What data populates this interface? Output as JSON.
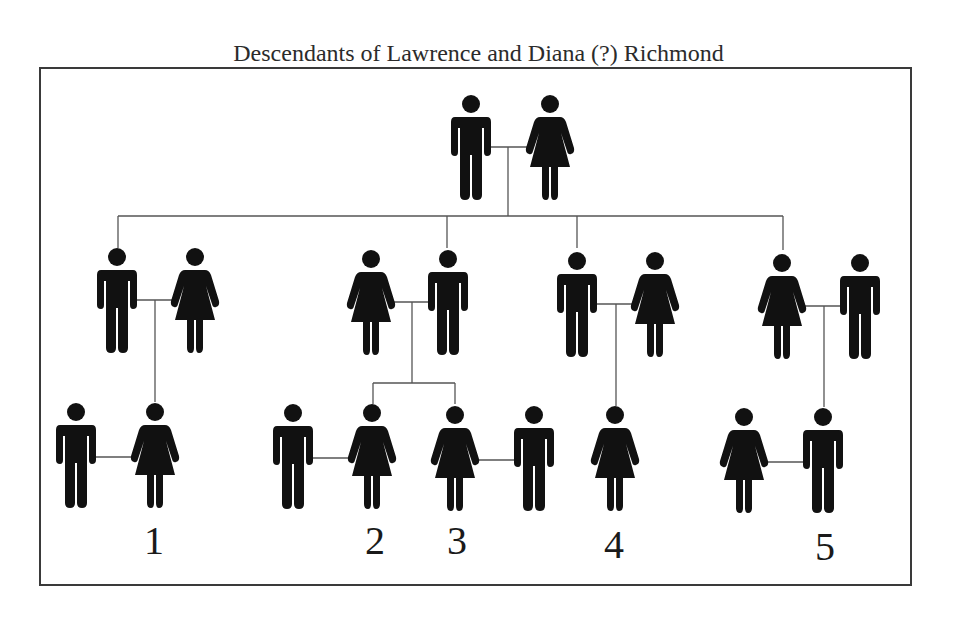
{
  "title": "Descendants of Lawrence and Diana (?) Richmond",
  "colors": {
    "figure": "#111111",
    "line": "#555555",
    "frame": "#3a3a3a",
    "text": "#2b2b2b"
  },
  "generations": [
    {
      "level": 0,
      "couples": [
        {
          "members": [
            {
              "sex": "male",
              "icon": "man-icon"
            },
            {
              "sex": "female",
              "icon": "woman-icon"
            }
          ]
        }
      ]
    },
    {
      "level": 1,
      "couples": [
        {
          "members": [
            {
              "sex": "male",
              "icon": "man-icon",
              "descendant": true
            },
            {
              "sex": "female",
              "icon": "woman-icon"
            }
          ]
        },
        {
          "members": [
            {
              "sex": "female",
              "icon": "woman-icon"
            },
            {
              "sex": "male",
              "icon": "man-icon",
              "descendant": true
            }
          ]
        },
        {
          "members": [
            {
              "sex": "male",
              "icon": "man-icon",
              "descendant": true
            },
            {
              "sex": "female",
              "icon": "woman-icon"
            }
          ]
        },
        {
          "members": [
            {
              "sex": "female",
              "icon": "woman-icon",
              "descendant": true
            },
            {
              "sex": "male",
              "icon": "man-icon"
            }
          ]
        }
      ]
    },
    {
      "level": 2,
      "couples": [
        {
          "members": [
            {
              "sex": "male",
              "icon": "man-icon"
            },
            {
              "sex": "female",
              "icon": "woman-icon",
              "descendant": true,
              "label": "1"
            }
          ]
        },
        {
          "members": [
            {
              "sex": "male",
              "icon": "man-icon"
            },
            {
              "sex": "female",
              "icon": "woman-icon",
              "descendant": true,
              "label": "2"
            }
          ]
        },
        {
          "members": [
            {
              "sex": "female",
              "icon": "woman-icon",
              "descendant": true,
              "label": "3"
            },
            {
              "sex": "male",
              "icon": "man-icon"
            }
          ]
        },
        {
          "members": [
            {
              "sex": "female",
              "icon": "woman-icon",
              "descendant": true,
              "label": "4"
            }
          ]
        },
        {
          "members": [
            {
              "sex": "female",
              "icon": "woman-icon"
            },
            {
              "sex": "male",
              "icon": "man-icon",
              "descendant": true,
              "label": "5"
            }
          ]
        }
      ]
    }
  ],
  "labels": [
    "1",
    "2",
    "3",
    "4",
    "5"
  ]
}
